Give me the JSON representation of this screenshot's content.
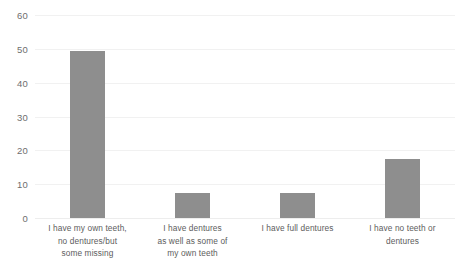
{
  "chart_data": {
    "type": "bar",
    "title": "",
    "subtitle": "",
    "xlabel": "",
    "ylabel": "",
    "ylim": [
      0,
      60
    ],
    "ytick_values": [
      0,
      10,
      20,
      30,
      40,
      50,
      60
    ],
    "ytick_labels": [
      "0",
      "10",
      "20",
      "30",
      "40",
      "50",
      "60"
    ],
    "grid": "horizontal",
    "legend": "none",
    "bar_color": "#8e8e8e",
    "gridline_color": "#f1f1f1",
    "tick_label_color": "#6e6e6e",
    "category_label_color": "#5d5d5d",
    "categories": [
      "I have my own teeth, no dentures/but some missing",
      "I have dentures as well as some of my own teeth",
      "I have full dentures",
      "I have no teeth or dentures"
    ],
    "category_lines": [
      [
        "I have my own teeth,",
        "no dentures/but",
        "some missing"
      ],
      [
        "I have dentures",
        "as well as some of",
        "my own teeth"
      ],
      [
        "I have full dentures"
      ],
      [
        "I have no teeth or",
        "dentures"
      ]
    ],
    "values": [
      49.5,
      7.5,
      7.5,
      17.5
    ]
  }
}
